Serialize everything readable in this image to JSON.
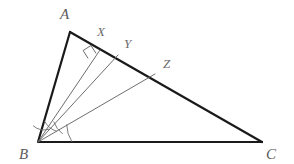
{
  "figure": {
    "background_color": "#ffffff",
    "outline_color": "#1a1a1a",
    "cevian_color": "#6e6e6e",
    "arc_color": "#6e6e6e",
    "label_color": "#5a5a5a"
  },
  "vertices": {
    "A": {
      "label": "A",
      "x": 70,
      "y": 32,
      "label_x": 60,
      "label_y": 19
    },
    "B": {
      "label": "B",
      "x": 38,
      "y": 142,
      "label_x": 19,
      "label_y": 159
    },
    "C": {
      "label": "C",
      "x": 262,
      "y": 142,
      "label_x": 266,
      "label_y": 159
    }
  },
  "points_on_ac": [
    {
      "label": "X",
      "x": 100,
      "y": 50,
      "label_x": 97,
      "label_y": 36
    },
    {
      "label": "Y",
      "x": 118,
      "y": 55,
      "label_x": 124,
      "label_y": 48
    },
    {
      "label": "Z",
      "x": 155,
      "y": 74,
      "label_x": 163,
      "label_y": 68
    }
  ],
  "segments": [
    {
      "name": "side-ab",
      "from": "A",
      "to": "B",
      "style": "solid-bold"
    },
    {
      "name": "side-ac",
      "from": "A",
      "to": "C",
      "style": "solid-bold"
    },
    {
      "name": "side-bc",
      "from": "B",
      "to": "C",
      "style": "solid-bold"
    },
    {
      "name": "cevian-bx",
      "from": "B",
      "to": "X",
      "style": "thin",
      "note": "altitude, perpendicular to AC"
    },
    {
      "name": "cevian-by",
      "from": "B",
      "to": "Y",
      "style": "thin"
    },
    {
      "name": "cevian-bz",
      "from": "B",
      "to": "Z",
      "style": "thin"
    }
  ],
  "marks": {
    "right_angle": {
      "name": "right-angle-at-x",
      "at_point": "X",
      "size": 12,
      "description": "square mark showing BX perpendicular to AC"
    },
    "angle_arcs": [
      {
        "name": "angle-arc-abx",
        "radius": 17
      },
      {
        "name": "angle-arc-xby",
        "radius": 22
      },
      {
        "name": "angle-arc-ybz",
        "radius": 28
      },
      {
        "name": "angle-arc-zbc",
        "radius": 34
      }
    ]
  }
}
